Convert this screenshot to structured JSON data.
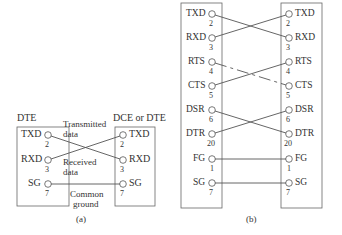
{
  "diagram_a": {
    "caption": "(a)",
    "left_title": "DTE",
    "right_title": "DCE or DTE",
    "annotations": {
      "transmitted_line1": "Transmitted",
      "transmitted_line2": "data",
      "received_line1": "Received",
      "received_line2": "data",
      "ground_line1": "Common",
      "ground_line2": "ground"
    },
    "left_pins": [
      {
        "name": "TXD",
        "pin": "2"
      },
      {
        "name": "RXD",
        "pin": "3"
      },
      {
        "name": "SG",
        "pin": "7"
      }
    ],
    "right_pins": [
      {
        "name": "TXD",
        "pin": "2"
      },
      {
        "name": "RXD",
        "pin": "3"
      },
      {
        "name": "SG",
        "pin": "7"
      }
    ],
    "connections": [
      {
        "from": "TXD",
        "to": "RXD",
        "style": "solid"
      },
      {
        "from": "RXD",
        "to": "TXD",
        "style": "solid"
      },
      {
        "from": "SG",
        "to": "SG",
        "style": "solid"
      }
    ]
  },
  "diagram_b": {
    "caption": "(b)",
    "left_pins": [
      {
        "name": "TXD",
        "pin": "2"
      },
      {
        "name": "RXD",
        "pin": "3"
      },
      {
        "name": "RTS",
        "pin": "4"
      },
      {
        "name": "CTS",
        "pin": "5"
      },
      {
        "name": "DSR",
        "pin": "6"
      },
      {
        "name": "DTR",
        "pin": "20"
      },
      {
        "name": "FG",
        "pin": "1"
      },
      {
        "name": "SG",
        "pin": "7"
      }
    ],
    "right_pins": [
      {
        "name": "TXD",
        "pin": "2"
      },
      {
        "name": "RXD",
        "pin": "3"
      },
      {
        "name": "RTS",
        "pin": "4"
      },
      {
        "name": "CTS",
        "pin": "5"
      },
      {
        "name": "DSR",
        "pin": "6"
      },
      {
        "name": "DTR",
        "pin": "20"
      },
      {
        "name": "FG",
        "pin": "1"
      },
      {
        "name": "SG",
        "pin": "7"
      }
    ],
    "connections": [
      {
        "from": "TXD",
        "to": "RXD",
        "style": "solid"
      },
      {
        "from": "RXD",
        "to": "TXD",
        "style": "solid"
      },
      {
        "from": "RTS",
        "to": "CTS",
        "style": "dashed"
      },
      {
        "from": "CTS",
        "to": "RTS",
        "style": "solid"
      },
      {
        "from": "DSR",
        "to": "DTR",
        "style": "solid"
      },
      {
        "from": "DTR",
        "to": "DSR",
        "style": "solid"
      },
      {
        "from": "FG",
        "to": "FG",
        "style": "solid"
      },
      {
        "from": "SG",
        "to": "SG",
        "style": "solid"
      }
    ]
  },
  "colors": {
    "line": "#555555",
    "text": "#333333",
    "box": "#666666"
  }
}
